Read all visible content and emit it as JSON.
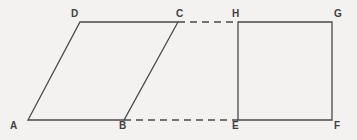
{
  "figure": {
    "width": 357,
    "height": 140,
    "background_color": "#f3f2f0",
    "stroke_color": "#4a4a4a",
    "label_color": "#3f3f3f",
    "stroke_width": 1.3,
    "dash_pattern": "7 5",
    "points": {
      "A": {
        "x": 28,
        "y": 120
      },
      "B": {
        "x": 124,
        "y": 120
      },
      "C": {
        "x": 178,
        "y": 22
      },
      "D": {
        "x": 80,
        "y": 22
      },
      "E": {
        "x": 238,
        "y": 120
      },
      "F": {
        "x": 332,
        "y": 120
      },
      "G": {
        "x": 332,
        "y": 22
      },
      "H": {
        "x": 238,
        "y": 22
      }
    },
    "shapes": [
      {
        "name": "parallelogram-abcd",
        "style": "solid",
        "vertices": [
          "A",
          "B",
          "C",
          "D"
        ],
        "path": "M 28 120 L 124 120 L 178 22 L 80 22 Z"
      },
      {
        "name": "rectangle-efgh",
        "style": "solid",
        "vertices": [
          "E",
          "F",
          "G",
          "H"
        ],
        "path": "M 238 120 L 332 120 L 332 22 L 238 22 Z"
      }
    ],
    "connectors": [
      {
        "name": "dashed-segment-ch",
        "style": "dashed",
        "from": "C",
        "to": "H",
        "path": "M 178 22 L 238 22"
      },
      {
        "name": "dashed-segment-be",
        "style": "dashed",
        "from": "B",
        "to": "E",
        "path": "M 124 120 L 238 120"
      }
    ],
    "labels": [
      {
        "name": "vertex-label-a",
        "text": "A",
        "left": 10,
        "top": 121
      },
      {
        "name": "vertex-label-b",
        "text": "B",
        "left": 119,
        "top": 121
      },
      {
        "name": "vertex-label-c",
        "text": "C",
        "left": 176,
        "top": 9
      },
      {
        "name": "vertex-label-d",
        "text": "D",
        "left": 71,
        "top": 9
      },
      {
        "name": "vertex-label-e",
        "text": "E",
        "left": 232,
        "top": 121
      },
      {
        "name": "vertex-label-f",
        "text": "F",
        "left": 334,
        "top": 121
      },
      {
        "name": "vertex-label-g",
        "text": "G",
        "left": 334,
        "top": 9
      },
      {
        "name": "vertex-label-h",
        "text": "H",
        "left": 232,
        "top": 9
      }
    ]
  }
}
